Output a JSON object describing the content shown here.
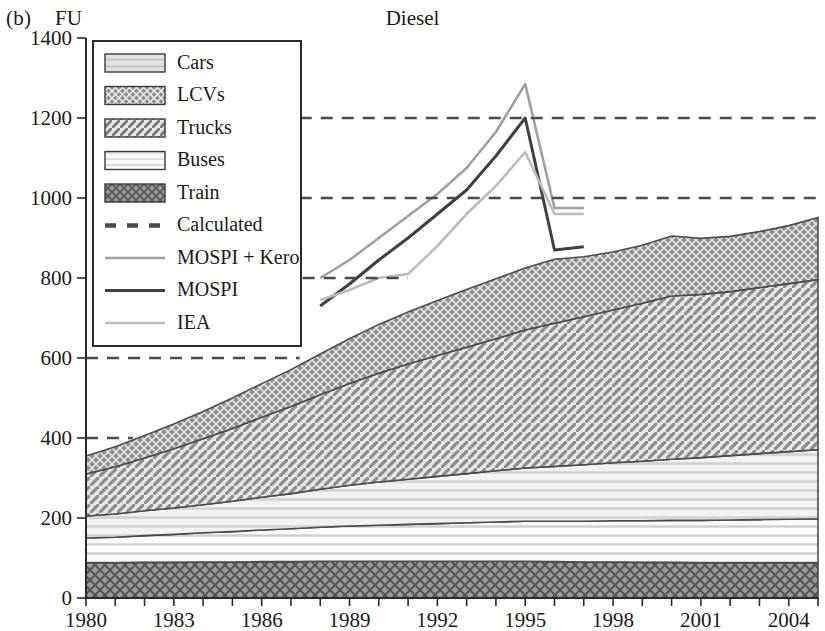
{
  "panel": {
    "tag": "(b)",
    "unit": "FU",
    "title": "Diesel"
  },
  "legend": {
    "items": [
      {
        "label": "Cars",
        "kind": "swatch",
        "pattern": "dots-light",
        "color": "#d8d8d8"
      },
      {
        "label": "LCVs",
        "kind": "swatch",
        "pattern": "dots-dark",
        "color": "#8a8a8a"
      },
      {
        "label": "Trucks",
        "kind": "swatch",
        "pattern": "diagonal",
        "color": "#b4b4b4"
      },
      {
        "label": "Buses",
        "kind": "swatch",
        "pattern": "horizontal-light",
        "color": "#efefef"
      },
      {
        "label": "Train",
        "kind": "swatch",
        "pattern": "crosshatch",
        "color": "#9a9a9a"
      },
      {
        "label": "Calculated",
        "kind": "dashed-line",
        "color": "#4a4a4a"
      },
      {
        "label": "MOSPI + Kero",
        "kind": "line",
        "color": "#a0a0a0"
      },
      {
        "label": "MOSPI",
        "kind": "line",
        "color": "#404040"
      },
      {
        "label": "IEA",
        "kind": "line",
        "color": "#bcbcbc"
      }
    ]
  },
  "chart_data": {
    "type": "area",
    "title": "Diesel",
    "xlabel": "",
    "ylabel": "FU",
    "xlim": [
      1980,
      2005
    ],
    "ylim": [
      0,
      1400
    ],
    "ytick_step": 200,
    "yticks": [
      0,
      200,
      400,
      600,
      800,
      1000,
      1200,
      1400
    ],
    "xticks": [
      1980,
      1981,
      1982,
      1983,
      1984,
      1985,
      1986,
      1987,
      1988,
      1989,
      1990,
      1991,
      1992,
      1993,
      1994,
      1995,
      1996,
      1997,
      1998,
      1999,
      2000,
      2001,
      2002,
      2003,
      2004,
      2005
    ],
    "xtick_labels_shown": [
      1980,
      1983,
      1986,
      1989,
      1992,
      1995,
      1998,
      2001,
      2004
    ],
    "grid": false,
    "legend_position": "upper-left",
    "stacking_order_bottom_to_top": [
      "Train",
      "Buses",
      "Cars",
      "Trucks",
      "LCVs"
    ],
    "x": [
      1980,
      1981,
      1982,
      1983,
      1984,
      1985,
      1986,
      1987,
      1988,
      1989,
      1990,
      1991,
      1992,
      1993,
      1994,
      1995,
      1996,
      1997,
      1998,
      1999,
      2000,
      2001,
      2002,
      2003,
      2004,
      2005
    ],
    "series": [
      {
        "name": "Train",
        "values": [
          88,
          88,
          89,
          89,
          90,
          90,
          91,
          91,
          92,
          92,
          92,
          92,
          92,
          92,
          92,
          92,
          91,
          90,
          90,
          89,
          89,
          88,
          88,
          88,
          88,
          88
        ]
      },
      {
        "name": "Buses",
        "values": [
          62,
          64,
          67,
          70,
          73,
          76,
          79,
          82,
          85,
          88,
          90,
          92,
          94,
          96,
          98,
          100,
          101,
          102,
          103,
          104,
          105,
          106,
          107,
          108,
          109,
          110
        ]
      },
      {
        "name": "Cars",
        "values": [
          55,
          58,
          62,
          66,
          70,
          76,
          82,
          88,
          95,
          102,
          108,
          113,
          118,
          123,
          128,
          133,
          137,
          141,
          145,
          149,
          153,
          157,
          161,
          165,
          169,
          173
        ]
      },
      {
        "name": "Trucks",
        "values": [
          105,
          118,
          132,
          148,
          165,
          182,
          200,
          218,
          236,
          254,
          272,
          288,
          302,
          316,
          330,
          345,
          358,
          370,
          382,
          395,
          408,
          408,
          410,
          415,
          420,
          425
        ]
      },
      {
        "name": "LCVs",
        "values": [
          45,
          50,
          56,
          62,
          68,
          76,
          84,
          92,
          102,
          112,
          122,
          130,
          138,
          144,
          150,
          155,
          160,
          150,
          145,
          145,
          150,
          140,
          138,
          140,
          145,
          155
        ]
      }
    ],
    "stack_totals": [
      355,
      378,
      406,
      435,
      466,
      500,
      536,
      571,
      610,
      648,
      684,
      715,
      744,
      771,
      798,
      825,
      847,
      853,
      865,
      882,
      905,
      899,
      904,
      916,
      931,
      951
    ],
    "lines": [
      {
        "name": "MOSPI + Kero",
        "color": "#a0a0a0",
        "x": [
          1988,
          1989,
          1990,
          1991,
          1992,
          1993,
          1994,
          1995,
          1996,
          1997
        ],
        "values": [
          800,
          845,
          900,
          955,
          1010,
          1075,
          1165,
          1285,
          975,
          975
        ]
      },
      {
        "name": "MOSPI",
        "color": "#404040",
        "x": [
          1988,
          1989,
          1990,
          1991,
          1992,
          1993,
          1994,
          1995,
          1996,
          1997
        ],
        "values": [
          730,
          785,
          845,
          900,
          960,
          1020,
          1105,
          1200,
          870,
          878
        ]
      },
      {
        "name": "IEA",
        "color": "#bcbcbc",
        "x": [
          1988,
          1989,
          1990,
          1991,
          1992,
          1993,
          1994,
          1995,
          1996,
          1997
        ],
        "values": [
          745,
          770,
          800,
          810,
          880,
          960,
          1030,
          1115,
          960,
          960
        ]
      }
    ],
    "calculated_reference_lines": [
      {
        "value": 1200,
        "x_start": 1987.3,
        "x_end": 2005
      },
      {
        "value": 1000,
        "x_start": 1987.3,
        "x_end": 2005
      },
      {
        "value": 800,
        "x_start": 1987.4,
        "x_end": 1991
      },
      {
        "value": 600,
        "x_start": 1980,
        "x_end": 1987.3
      },
      {
        "value": 400,
        "x_start": 1980,
        "x_end": 1981.6
      }
    ]
  }
}
